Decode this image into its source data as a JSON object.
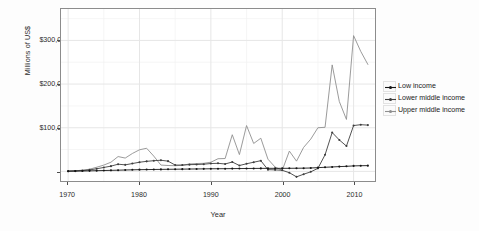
{
  "chart_data": {
    "type": "line",
    "title": "",
    "xlabel": "Year",
    "ylabel": "Millions of US$",
    "xlim": [
      1969,
      2013
    ],
    "ylim": [
      -22000,
      372000
    ],
    "xticks": [
      1970,
      1980,
      1990,
      2000,
      2010
    ],
    "xticklabels": [
      "1970",
      "1980",
      "1990",
      "2000",
      "2010"
    ],
    "yticks": [
      0,
      100000,
      200000,
      300000
    ],
    "yticklabels": [
      "$0",
      "$100,000",
      "$200,000",
      "$300,000"
    ],
    "grid": true,
    "legend_position": "right",
    "x": [
      1970,
      1971,
      1972,
      1973,
      1974,
      1975,
      1976,
      1977,
      1978,
      1979,
      1980,
      1981,
      1982,
      1983,
      1984,
      1985,
      1986,
      1987,
      1988,
      1989,
      1990,
      1991,
      1992,
      1993,
      1994,
      1995,
      1996,
      1997,
      1998,
      1999,
      2000,
      2001,
      2002,
      2003,
      2004,
      2005,
      2006,
      2007,
      2008,
      2009,
      2010,
      2011,
      2012
    ],
    "series": [
      {
        "name": "Low income",
        "color": "#151515",
        "values": [
          500,
          700,
          900,
          1200,
          1600,
          2000,
          2400,
          2800,
          3200,
          3600,
          4000,
          4200,
          4400,
          4600,
          4800,
          5000,
          5200,
          5400,
          5600,
          5800,
          6000,
          6100,
          6200,
          6400,
          6500,
          6600,
          6800,
          6900,
          7000,
          7000,
          7000,
          7100,
          7200,
          7400,
          7800,
          8600,
          9400,
          10200,
          11000,
          11600,
          12600,
          13000,
          13200
        ]
      },
      {
        "name": "Lower middle income",
        "color": "#3d3d3d",
        "values": [
          600,
          1100,
          2000,
          3400,
          6000,
          9000,
          12000,
          16500,
          15000,
          18000,
          21000,
          23000,
          24500,
          25500,
          23500,
          14500,
          14500,
          15500,
          15800,
          16500,
          18000,
          18500,
          17000,
          21500,
          13500,
          17500,
          21000,
          24500,
          4000,
          3500,
          2500,
          -3000,
          -12500,
          -6500,
          -1000,
          7000,
          38000,
          89000,
          72000,
          58000,
          105000,
          107000,
          106000
        ]
      },
      {
        "name": "Upper middle income",
        "color": "#8f8f8f",
        "values": [
          700,
          1400,
          2800,
          5000,
          9500,
          14500,
          21000,
          34000,
          30500,
          41000,
          49500,
          53000,
          35000,
          14500,
          13500,
          13000,
          14000,
          17000,
          18000,
          18500,
          21000,
          29000,
          29500,
          84000,
          38500,
          105000,
          64000,
          76000,
          28000,
          10000,
          2500,
          46500,
          23500,
          55000,
          74000,
          100000,
          101000,
          244000,
          160000,
          119000,
          311000,
          275000,
          245000
        ]
      }
    ]
  },
  "legend": {
    "items": [
      {
        "label": "Low income"
      },
      {
        "label": "Lower middle income"
      },
      {
        "label": "Upper middle income"
      }
    ]
  }
}
